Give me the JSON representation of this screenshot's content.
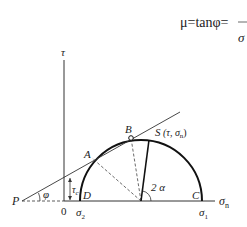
{
  "formula": {
    "text": "μ=tanφ=",
    "denominator": "σ"
  },
  "axes": {
    "tau_label": "τ",
    "sigma_label": "σ",
    "sigma_sub": "n",
    "origin_label": "0"
  },
  "points": {
    "P": "P",
    "A": "A",
    "B": "B",
    "S": "S",
    "S_coords": "(τ, σ",
    "S_coords_sub": "n",
    "S_coords_close": ")",
    "C": "C",
    "D": "D"
  },
  "annotations": {
    "phi": "φ",
    "two_alpha": "2 α",
    "tau_c": "τ",
    "tau_c_sub": "c",
    "sigma1": "σ",
    "sigma1_sub": "1",
    "sigma2": "σ",
    "sigma2_sub": "2"
  }
}
